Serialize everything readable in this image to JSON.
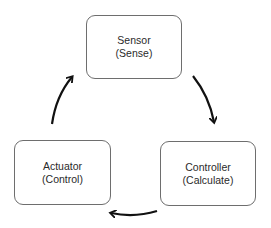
{
  "diagram": {
    "type": "cycle",
    "nodes": [
      {
        "id": "sensor",
        "title": "Sensor",
        "subtitle": "(Sense)"
      },
      {
        "id": "controller",
        "title": "Controller",
        "subtitle": "(Calculate)"
      },
      {
        "id": "actuator",
        "title": "Actuator",
        "subtitle": "(Control)"
      }
    ],
    "edges": [
      {
        "from": "sensor",
        "to": "controller"
      },
      {
        "from": "controller",
        "to": "actuator"
      },
      {
        "from": "actuator",
        "to": "sensor"
      }
    ]
  }
}
